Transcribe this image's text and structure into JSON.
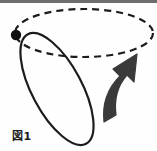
{
  "figure": {
    "caption": "図1",
    "background_color": "#fefefe",
    "stroke_color": "#1c1c1c",
    "arrow_fill_color": "#3a3a3a",
    "top_rule_color": "#6e6e6e",
    "marker_color": "#111111",
    "elements": {
      "dashed_ellipse": {
        "name": "circular-path",
        "style": "dashed",
        "center_x": 84,
        "center_y": 33,
        "radius_x": 69,
        "radius_y": 24,
        "rotation_deg": 0,
        "dash_pattern": "7 5",
        "stroke_width": 2
      },
      "solid_ellipse": {
        "name": "tilted-loop",
        "style": "solid",
        "center_x": 57,
        "center_y": 89,
        "radius_x": 62,
        "radius_y": 25,
        "rotation_deg": 62,
        "stroke_width": 2
      },
      "marker_dot": {
        "name": "intersection-point",
        "x": 16,
        "y": 35,
        "radius": 5
      },
      "curved_arrow": {
        "name": "rotation-direction-arrow",
        "tail_x": 104,
        "tail_y": 121,
        "tip_x": 136,
        "tip_y": 55,
        "direction": "up-right"
      }
    }
  }
}
